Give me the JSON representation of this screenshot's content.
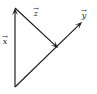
{
  "figure": {
    "width": 97,
    "height": 94,
    "background_color": "#ffffff",
    "stroke_color": "#1a1a1a"
  },
  "labels": {
    "x": {
      "symbol": "x",
      "accent": "→",
      "accent_name": "vector-arrow-overline"
    },
    "y": {
      "symbol": "y",
      "accent": "→",
      "accent_name": "vector-arrow-overline"
    },
    "z": {
      "symbol": "z",
      "accent": "→",
      "accent_name": "vector-arrow-overline"
    }
  },
  "chart_data": {
    "type": "diagram",
    "title": "",
    "xlabel": "",
    "ylabel": "",
    "coordinate_space": {
      "x_range": [
        0,
        97
      ],
      "y_range": [
        0,
        94
      ],
      "origin": "top-left-pixels"
    },
    "points": {
      "origin_bottom": [
        15,
        87
      ],
      "x_tip_top": [
        15,
        8
      ],
      "z_tip": [
        58,
        48
      ],
      "y_tip": [
        82,
        22
      ]
    },
    "vectors": [
      {
        "name": "x",
        "label": "x⃗",
        "tail": [
          15,
          87
        ],
        "head": [
          15,
          8
        ],
        "direction": "up",
        "arrowhead": true,
        "label_position": [
          2,
          34
        ]
      },
      {
        "name": "z",
        "label": "z⃗",
        "tail": [
          15,
          8
        ],
        "head": [
          58,
          48
        ],
        "direction": "down-right",
        "arrowhead": true,
        "label_position": [
          33,
          6
        ]
      },
      {
        "name": "y",
        "label": "y⃗",
        "tail": [
          15,
          87
        ],
        "head": [
          82,
          22
        ],
        "direction": "up-right",
        "arrowhead": true,
        "label_position": [
          81,
          8
        ]
      }
    ],
    "grid": false,
    "legend": false
  }
}
